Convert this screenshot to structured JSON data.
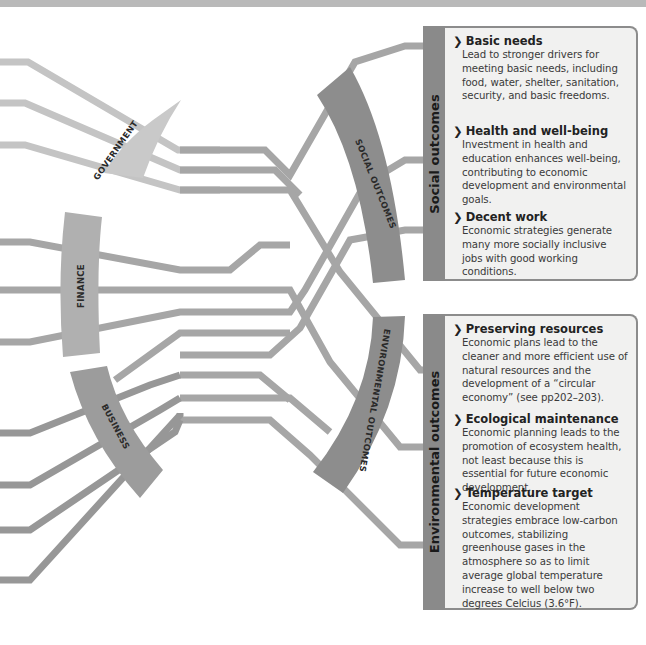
{
  "diagram": {
    "inputs": [
      {
        "label": "GOVERNMENT",
        "color": "#c9c9c9"
      },
      {
        "label": "FINANCE",
        "color": "#b0b0b0"
      },
      {
        "label": "BUSINESS",
        "color": "#9c9c9c"
      }
    ],
    "outcome_arcs": [
      {
        "label": "SOCIAL OUTCOMES",
        "color": "#8d8d8d"
      },
      {
        "label": "ENVIRONMENTAL OUTCOMES",
        "color": "#8d8d8d"
      }
    ]
  },
  "panels": {
    "social": {
      "title": "Social outcomes",
      "items": [
        {
          "heading": "Basic needs",
          "text": "Lead to stronger drivers for meeting basic needs, including food, water, shelter, sanitation, security, and basic freedoms."
        },
        {
          "heading": "Health and well-being",
          "text": "Investment in health and education enhances well-being, contributing to economic development and environmental goals."
        },
        {
          "heading": "Decent work",
          "text": "Economic strategies generate many more socially inclusive jobs with good working conditions."
        }
      ]
    },
    "environmental": {
      "title": "Environmental outcomes",
      "items": [
        {
          "heading": "Preserving resources",
          "text": "Economic plans lead to the cleaner and more efficient use of natural resources and the development of a “circular economy” (see pp202–203)."
        },
        {
          "heading": "Ecological maintenance",
          "text": "Economic planning leads to the promotion of ecosystem health, not least because this is essential for future economic development."
        },
        {
          "heading": "Temperature target",
          "text": "Economic development strategies embrace low-carbon outcomes, stabilizing greenhouse gases in the atmosphere so as to limit average global temperature increase to well below two degrees Celcius (3.6°F)."
        }
      ]
    }
  },
  "chevron_glyph": "❯"
}
